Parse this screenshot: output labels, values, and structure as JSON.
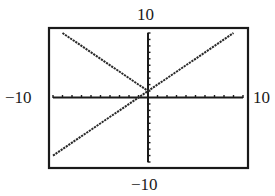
{
  "chart_data": {
    "type": "line",
    "title": "",
    "xlabel": "",
    "ylabel": "",
    "window": {
      "xmin": -10,
      "xmax": 10,
      "ymin": -10,
      "ymax": 10,
      "xscl": 1,
      "yscl": 1
    },
    "xlim": [
      -10,
      10
    ],
    "ylim": [
      -10,
      10
    ],
    "grid": false,
    "legend": null,
    "tick_labels": {
      "ymax": "10",
      "ymin": "−10",
      "xmin": "−10",
      "xmax": "10"
    },
    "series": [
      {
        "name": "y = x + 1",
        "x": [
          -10,
          9
        ],
        "y": [
          -9,
          10
        ]
      },
      {
        "name": "y = -x + 1 (x ≤ 0)",
        "x": [
          -9,
          0
        ],
        "y": [
          10,
          1
        ]
      }
    ],
    "frame_color": "#1a1a1a",
    "line_color": "#2a2a2a",
    "axis_color": "#1a1a1a"
  }
}
